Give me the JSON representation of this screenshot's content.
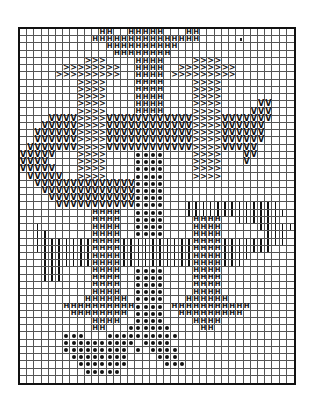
{
  "chart": {
    "title": "",
    "cols": 38,
    "rows": 49,
    "legend": {
      "H": {
        "name": "h-stitch",
        "glyph": "H"
      },
      "V": {
        "name": "v-stitch",
        "glyph": "V"
      },
      "A": {
        "name": "arrow-stitch",
        "glyph": ">"
      },
      "o": {
        "name": "dot-stitch",
        "glyph": "●"
      },
      "I": {
        "name": "bar-stitch",
        "glyph": "|"
      }
    },
    "colors": {
      "ink": "#111111",
      "grid": "#555555",
      "background": "#ffffff"
    },
    "pattern": [
      "...........HH..HHHHH...HH.............",
      "..........HHHHHHHHHHHHHHH.............",
      "............HHHHHHHHHH................",
      ".............HHHHHHHH.................",
      ".........AAA....HHHH....AAAA..........",
      "......AAAAAAAA..HHHH..AAAAAAAA........",
      ".....AAAAAAAAA..HHHH.AAAAAAAAA........",
      "........AAAA....HHHH....AAAA..........",
      "........AAAA....HHHH....AAAA..........",
      "........AAAA....HHHH....AAAA..........",
      "........AAAA....HHHH....AAAA.....VV...",
      "........AAAA....HHHH....AAAA....VVV...",
      "....VVVVAAAAVVVVVVVVVVVVAAAAVVVVVVV...",
      "...VVVVVAAAAVVVVVVVVVVVVAAAAVVVVVV....",
      "..VVVVVVAAAAVVVVVVVVVVVVAAAAVVVVVV....",
      "..VVVVVVAAAAVVVVVVVVVVVVAAAAVVVVVV....",
      ".VVVVVVVAAAAVVVVVVVVVVVVAAAAVVVVV.....",
      "VVVVV...AAAA....oooo....AAAA...VV......",
      "VVVV....AAAA....oooo....AAAA...V......",
      "VVVVV...AAAA....oooo....AAAA..........",
      ".VVVVV..AAAA....oooo....AAAA..........",
      "..VVVVVVVVVVVVVVoooo..................",
      "...VVVVVVVVVVVVVoooo..................",
      "....VVVVVVVVVVVVoooo..................",
      ".....VVVVVVVVVVVoooo...IIIIIIIIIIIII..",
      "..........HHHH..oooo...IIIIIIIIIIIIII.",
      "..........HHHH..oooo....HHHH..IIIIII..",
      "..I.......HHHH..oooo....HHHH.....IIIII",
      "..II......HHHH..oooo....HHHH......III.",
      "..IIIIIIIIHHHHIIIIIIIIIIHHHHIIIIIIIII.",
      "..IIIIIIIIHHHHIIIIIIIIIIHHHHIIIIIII...",
      "...IIIIIIIHHHHIIIIIIIIIIHHHHIIII......",
      "...IIIIIIIHHHHIIIIIIIIIIHHHHIII.......",
      "...III....HHHH..oooo....HHHH..........",
      "...III....HHHH..oooo....HHHH..........",
      "..........HHHH..oooo....HHHH..........",
      "..........HHHH..oooo....HHHH..........",
      ".........HHHHHH.oooo...HHHHHH.........",
      "......HHHHHHHHHHoooo.HHHHHHHHHHH......",
      ".......HHHHHHHH.oooo..HHHHHHHHH.......",
      "..........HHHH..oooo....HHHH..........",
      "..........HH...oooooo....HH...........",
      "......ooo...oooooooooo................",
      "......oooooooooo.oooo.................",
      "......ooooooooo.o.oooo................",
      ".......oooooooo....ooo................",
      "........ooooooo.....ooo...............",
      ".........ooooo........................",
      "......................................"
    ],
    "speck": {
      "col": 30,
      "row": 1
    }
  }
}
